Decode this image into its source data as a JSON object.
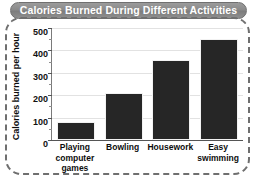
{
  "chart_data": {
    "type": "bar",
    "title": "Calories Burned During Different Activities",
    "categories": [
      "Playing computer games",
      "Bowling",
      "Housework",
      "Easy swimming"
    ],
    "values": [
      80,
      210,
      355,
      450
    ],
    "xlabel": "",
    "ylabel": "Calories burned per hour",
    "ylim": [
      0,
      500
    ],
    "yticks": [
      0,
      100,
      200,
      300,
      400,
      500
    ],
    "ytick_labels": [
      "0",
      "100",
      "200",
      "300",
      "400",
      "500"
    ],
    "grid": true,
    "legend": false,
    "bar_color": "#262626",
    "title_background": "#8a8a8a",
    "title_text_color": "#ffffff",
    "gridline_color": "#e2e2e2",
    "frame_color": "#6f6f6f"
  },
  "category_lines": [
    [
      "Playing",
      "computer",
      "games"
    ],
    [
      "Bowling"
    ],
    [
      "Housework"
    ],
    [
      "Easy",
      "swimming"
    ]
  ]
}
